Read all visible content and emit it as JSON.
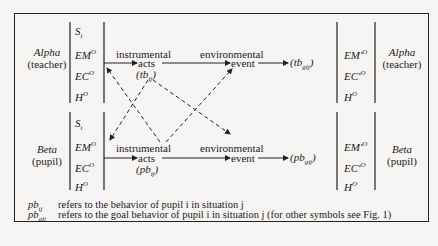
{
  "figure": {
    "alpha": {
      "name": "Alpha",
      "role": "(teacher)"
    },
    "beta": {
      "name": "Beta",
      "role": "(pupil)"
    },
    "left_vars": [
      "S_i",
      "EM^O",
      "EC^O",
      "H^O"
    ],
    "left_vars_display": {
      "s": "S",
      "s_sub": "i",
      "em": "EM",
      "ec": "EC",
      "h": "H",
      "sup": "O"
    },
    "right_vars_display": {
      "em": "EM'",
      "ec": "EC'",
      "h": "H",
      "sup": "O"
    },
    "flow": {
      "instrumental": "instrumental",
      "acts": "acts",
      "environmental": "environmental",
      "event": "event"
    },
    "alpha_acts_label": {
      "base": "(tb",
      "sub": "ij",
      "end": ")"
    },
    "beta_acts_label": {
      "base": "(pb",
      "sub": "ij",
      "end": ")"
    },
    "alpha_outcome": {
      "base": "(tb",
      "sub": "gij",
      "end": ")"
    },
    "beta_outcome": {
      "base": "(pb",
      "sub": "gij",
      "end": ")"
    }
  },
  "legend": [
    {
      "symbol": "pb",
      "sub": "ij",
      "text": "refers to the behavior of pupil i in situation j"
    },
    {
      "symbol": "pb",
      "sub": "gij",
      "text": "refers to the goal behavior of pupil i in situation j (for other symbols see Fig. 1)"
    }
  ]
}
